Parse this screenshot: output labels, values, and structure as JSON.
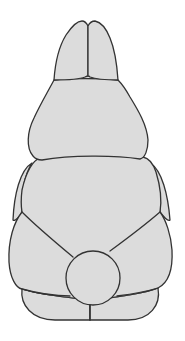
{
  "figure": {
    "style": "line-art",
    "colors": {
      "fill": "#dcdcdc",
      "outline": "#333333",
      "background": "#ffffff"
    },
    "parts": [
      "left-ear",
      "right-ear",
      "head",
      "left-arm",
      "right-arm",
      "body",
      "left-foot",
      "right-foot",
      "tail"
    ]
  }
}
